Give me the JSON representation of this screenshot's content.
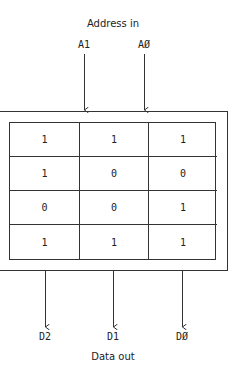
{
  "diagram": {
    "input_title": "Address in",
    "inputs": [
      {
        "label": "A1"
      },
      {
        "label": "AØ"
      }
    ],
    "memory": {
      "rows": [
        [
          "1",
          "1",
          "1"
        ],
        [
          "1",
          "0",
          "0"
        ],
        [
          "0",
          "0",
          "1"
        ],
        [
          "1",
          "1",
          "1"
        ]
      ]
    },
    "outputs": [
      {
        "label": "D2"
      },
      {
        "label": "D1"
      },
      {
        "label": "DØ"
      }
    ],
    "output_title": "Data out"
  }
}
